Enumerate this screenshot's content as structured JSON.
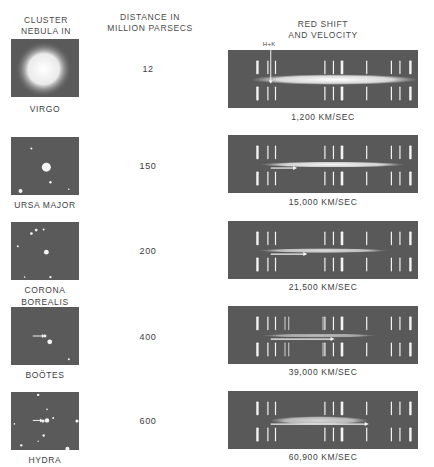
{
  "headers": {
    "cluster": [
      "CLUSTER",
      "NEBULA IN"
    ],
    "distance": [
      "DISTANCE IN",
      "MILLION PARSECS"
    ],
    "redshift": [
      "RED SHIFT",
      "AND VELOCITY"
    ]
  },
  "hk_label": "H+K",
  "rows": [
    {
      "name": [
        "VIRGO"
      ],
      "distance": "12",
      "velocity": "1,200 KM/SEC",
      "velocity_kms": 1200,
      "distance_mpc": 12
    },
    {
      "name": [
        "URSA MAJOR"
      ],
      "distance": "150",
      "velocity": "15,000 KM/SEC",
      "velocity_kms": 15000,
      "distance_mpc": 150
    },
    {
      "name": [
        "CORONA",
        "BOREALIS"
      ],
      "distance": "200",
      "velocity": "21,500 KM/SEC",
      "velocity_kms": 21500,
      "distance_mpc": 200
    },
    {
      "name": [
        "BOÖTES"
      ],
      "distance": "400",
      "velocity": "39,000 KM/SEC",
      "velocity_kms": 39000,
      "distance_mpc": 400
    },
    {
      "name": [
        "HYDRA"
      ],
      "distance": "600",
      "velocity": "60,900 KM/SEC",
      "velocity_kms": 60900,
      "distance_mpc": 600
    }
  ],
  "colors": {
    "plate": "#595959",
    "line": "#f2f2f2",
    "text": "#3d3d3d"
  }
}
